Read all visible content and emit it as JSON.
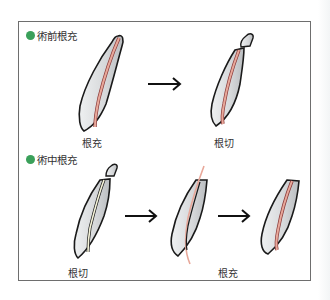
{
  "colors": {
    "bullet": "#3aa05a",
    "tooth_fill": "#dcdee0",
    "outline": "#1a1a1a",
    "filling": "#e8a89a",
    "filling_edge": "#8a3a3a",
    "root_canal_empty": "#f4f2d8",
    "frame": "#6e6e6e"
  },
  "sections": [
    {
      "title": "術前根充",
      "steps": [
        {
          "label": "根充",
          "icon": "tooth-root-filled-icon"
        },
        {
          "label": "根切",
          "icon": "tooth-apex-resected-icon"
        }
      ]
    },
    {
      "title": "術中根充",
      "steps": [
        {
          "label": "根切",
          "icon": "tooth-apex-resected-unfilled-icon"
        },
        {
          "label": "根充",
          "icon": "tooth-cut-line-icon"
        },
        {
          "label": "",
          "icon": "tooth-retrograde-filled-icon"
        }
      ]
    }
  ],
  "arrows": [
    {
      "name": "arrow-1",
      "glyph": "→"
    },
    {
      "name": "arrow-2",
      "glyph": "→"
    },
    {
      "name": "arrow-3",
      "glyph": "→"
    }
  ]
}
